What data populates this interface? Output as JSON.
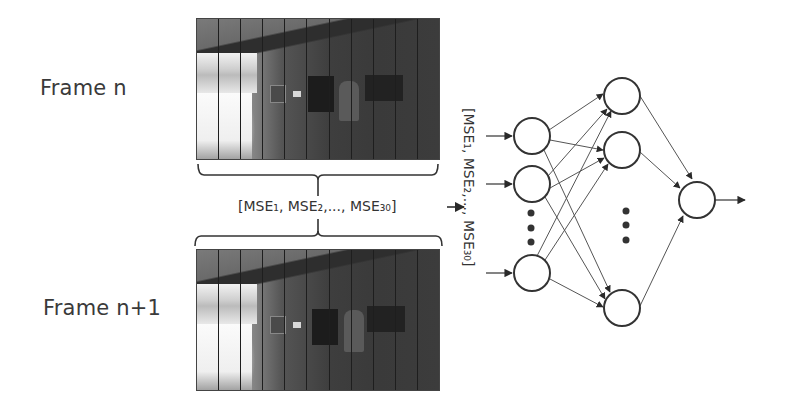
{
  "labels": {
    "frame_top": "Frame n",
    "frame_bottom": "Frame n+1",
    "mse_vector": "[MSE₁, MSE₂,..., MSE₃₀]",
    "mse_vector_vertical": "[MSE₁, MSE₂,..., MSE₃₀]"
  },
  "frames": [
    {
      "name": "frame-n",
      "stripe_count": 11
    },
    {
      "name": "frame-n-plus-1",
      "stripe_count": 11
    }
  ],
  "network": {
    "input_layer": {
      "visible_nodes": 3,
      "ellipsis": true
    },
    "hidden_layer": {
      "visible_nodes": 3,
      "ellipsis": true
    },
    "output_layer": {
      "visible_nodes": 1
    }
  },
  "colors": {
    "text": "#3a3a3a",
    "line": "#333333",
    "node_stroke": "#333333",
    "background": "#ffffff"
  }
}
